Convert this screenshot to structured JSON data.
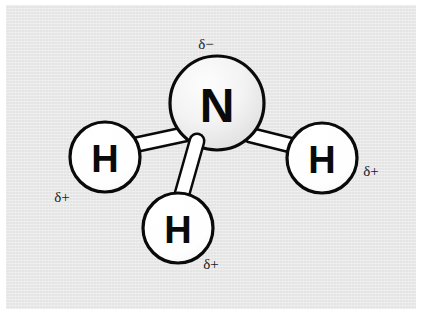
{
  "diagram": {
    "background_color": "#e9e9e9",
    "border_color": "#ffffff",
    "outline_color": "#0a0a0a",
    "atoms": [
      {
        "id": "nitrogen",
        "symbol": "N",
        "element_name": "nitrogen",
        "cx": 217,
        "cy": 103,
        "r": 47,
        "fill": "#f2f2f2",
        "font_size": 48,
        "charge": {
          "text": "δ−",
          "name": "delta-negative",
          "x": 206,
          "y": 44
        }
      },
      {
        "id": "hydrogen-left",
        "symbol": "H",
        "element_name": "hydrogen",
        "cx": 105,
        "cy": 157,
        "r": 35,
        "fill": "#ffffff",
        "font_size": 38,
        "charge": {
          "text": "δ+",
          "name": "delta-positive",
          "x": 62,
          "y": 197
        }
      },
      {
        "id": "hydrogen-right",
        "symbol": "H",
        "element_name": "hydrogen",
        "cx": 322,
        "cy": 158,
        "r": 35,
        "fill": "#ffffff",
        "font_size": 38,
        "charge": {
          "text": "δ+",
          "name": "delta-positive",
          "x": 371,
          "y": 171
        }
      },
      {
        "id": "hydrogen-bottom",
        "symbol": "H",
        "element_name": "hydrogen",
        "cx": 178,
        "cy": 228,
        "r": 35,
        "fill": "#ffffff",
        "font_size": 38,
        "charge": {
          "text": "δ+",
          "name": "delta-positive",
          "x": 211,
          "y": 264
        }
      }
    ],
    "bonds": [
      {
        "id": "bond-n-h-left",
        "from": "nitrogen",
        "to": "hydrogen-left",
        "x1": 186,
        "y1": 134,
        "x2": 130,
        "y2": 146,
        "width": 13
      },
      {
        "id": "bond-n-h-right",
        "from": "nitrogen",
        "to": "hydrogen-right",
        "x1": 250,
        "y1": 135,
        "x2": 298,
        "y2": 147,
        "width": 13
      },
      {
        "id": "bond-n-h-bottom",
        "from": "nitrogen",
        "to": "hydrogen-bottom",
        "x1": 197,
        "y1": 141,
        "x2": 182,
        "y2": 194,
        "width": 13
      }
    ]
  }
}
